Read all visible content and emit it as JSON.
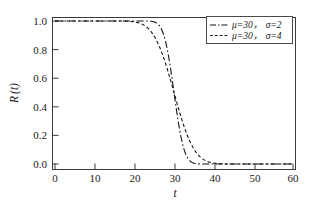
{
  "chart_data": {
    "type": "line",
    "title": "",
    "xlabel": "t",
    "ylabel": "R (t)",
    "xlim": [
      0,
      60
    ],
    "ylim": [
      0.0,
      1.0
    ],
    "grid": false,
    "legend_position": "top-right",
    "xticks": [
      0,
      10,
      20,
      30,
      40,
      50,
      60
    ],
    "xtick_labels": [
      "0",
      "10",
      "20",
      "30",
      "40",
      "50",
      "60"
    ],
    "yticks": [
      0.0,
      0.2,
      0.4,
      0.6,
      0.8,
      1.0
    ],
    "ytick_labels": [
      "0.0",
      "0.2",
      "0.4",
      "0.6",
      "0.8",
      "1.0"
    ],
    "x": [
      0,
      2,
      4,
      6,
      8,
      10,
      12,
      14,
      16,
      18,
      20,
      21,
      22,
      23,
      24,
      25,
      26,
      27,
      28,
      29,
      30,
      31,
      32,
      33,
      34,
      35,
      36,
      37,
      38,
      39,
      40,
      42,
      44,
      46,
      48,
      50,
      52,
      54,
      56,
      58,
      60
    ],
    "series": [
      {
        "name": "mu=30, sigma=2",
        "mu": 30,
        "sigma": 2,
        "dash": "dash-dot",
        "color": "#151515",
        "values": [
          1.0,
          1.0,
          1.0,
          1.0,
          1.0,
          1.0,
          1.0,
          1.0,
          1.0,
          1.0,
          1.0,
          0.999,
          0.997,
          0.9998,
          0.9987,
          0.9938,
          0.9772,
          0.9332,
          0.8413,
          0.6915,
          0.5,
          0.3085,
          0.1587,
          0.0668,
          0.0228,
          0.0062,
          0.0013,
          0.0002,
          0.0,
          0.0,
          0.0,
          0.0,
          0.0,
          0.0,
          0.0,
          0.0,
          0.0,
          0.0,
          0.0,
          0.0,
          0.0
        ]
      },
      {
        "name": "mu=30, sigma=4",
        "mu": 30,
        "sigma": 4,
        "dash": "dashed",
        "color": "#151515",
        "values": [
          1.0,
          1.0,
          1.0,
          1.0,
          1.0,
          1.0,
          1.0,
          1.0,
          1.0,
          0.9987,
          0.9938,
          0.9878,
          0.9772,
          0.9599,
          0.9332,
          0.8944,
          0.8413,
          0.7734,
          0.6915,
          0.5987,
          0.5,
          0.4013,
          0.3085,
          0.2266,
          0.1587,
          0.1056,
          0.0668,
          0.0401,
          0.0228,
          0.0122,
          0.0062,
          0.0013,
          0.0002,
          0.0,
          0.0,
          0.0,
          0.0,
          0.0,
          0.0,
          0.0,
          0.0
        ]
      }
    ],
    "legend": [
      {
        "mu_label": "μ=30，",
        "sigma_label": "σ=2",
        "dash": "dash-dot"
      },
      {
        "mu_label": "μ=30，",
        "sigma_label": "σ=4",
        "dash": "dashed"
      }
    ]
  },
  "axes": {
    "x_title": "t",
    "y_title_main": "R",
    "y_title_paren_open": "(",
    "y_title_var": "t",
    "y_title_paren_close": ")"
  }
}
